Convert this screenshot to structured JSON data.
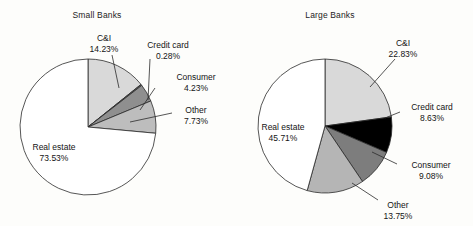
{
  "figure": {
    "background": "#fdfdfb",
    "line_color": "#2b2b2b",
    "text_color": "#141414"
  },
  "panels": [
    {
      "key": "small",
      "title": "Small Banks",
      "title_x": 97,
      "title_y": 10,
      "cx": 88,
      "cy": 127,
      "r": 68,
      "start_angle_deg": -90,
      "labels": [
        {
          "name": "C&I",
          "value": "14.23%",
          "x": 104,
          "y": 33,
          "align": "center",
          "leader": [
            112,
            55,
            119,
            88
          ]
        },
        {
          "name": "Credit card",
          "value": "0.28%",
          "x": 168,
          "y": 40,
          "align": "center",
          "leader": [
            150,
            59,
            148,
            100
          ]
        },
        {
          "name": "Consumer",
          "value": "4.23%",
          "x": 196,
          "y": 72,
          "align": "center",
          "leader": [
            155,
            88,
            140,
            110
          ]
        },
        {
          "name": "Other",
          "value": "7.73%",
          "x": 196,
          "y": 105,
          "align": "center",
          "leader": [
            172,
            113,
            130,
            122
          ]
        },
        {
          "name": "Real estate",
          "value": "73.53%",
          "x": 54,
          "y": 142,
          "align": "center",
          "leader": null
        }
      ]
    },
    {
      "key": "large",
      "title": "Large Banks",
      "title_x": 330,
      "title_y": 10,
      "cx": 325,
      "cy": 126,
      "r": 67,
      "start_angle_deg": -90,
      "labels": [
        {
          "name": "C&I",
          "value": "22.83%",
          "x": 403,
          "y": 38,
          "align": "center",
          "leader": [
            395,
            59,
            370,
            87
          ]
        },
        {
          "name": "Credit card",
          "value": "8.63%",
          "x": 432,
          "y": 102,
          "align": "center",
          "leader": [
            400,
            112,
            385,
            118
          ]
        },
        {
          "name": "Consumer",
          "value": "9.08%",
          "x": 431,
          "y": 160,
          "align": "center",
          "leader": [
            397,
            164,
            372,
            152
          ]
        },
        {
          "name": "Other",
          "value": "13.75%",
          "x": 398,
          "y": 200,
          "align": "center",
          "leader": [
            378,
            200,
            352,
            183
          ]
        },
        {
          "name": "Real estate",
          "value": "45.71%",
          "x": 283,
          "y": 122,
          "align": "center",
          "leader": null
        }
      ]
    }
  ],
  "chart_data": {
    "type": "pie",
    "title": "",
    "charts": [
      {
        "title": "Small Banks",
        "labels": [
          "C&I",
          "Credit card",
          "Consumer",
          "Other",
          "Real estate"
        ],
        "values": [
          14.23,
          0.28,
          4.23,
          7.73,
          73.53
        ],
        "value_labels": [
          "14.23%",
          "0.28%",
          "4.23%",
          "7.73%",
          "73.53%"
        ],
        "colors": [
          "#d9d9d9",
          "#5a5a5a",
          "#8f8f8f",
          "#bdbdbd",
          "#ffffff"
        ],
        "start_angle_deg": -90,
        "direction": "clockwise"
      },
      {
        "title": "Large Banks",
        "labels": [
          "C&I",
          "Credit card",
          "Consumer",
          "Other",
          "Real estate"
        ],
        "values": [
          22.83,
          8.63,
          9.08,
          13.75,
          45.71
        ],
        "value_labels": [
          "22.83%",
          "8.63%",
          "9.08%",
          "13.75%",
          "45.71%"
        ],
        "colors": [
          "#d9d9d9",
          "#000000",
          "#7d7d7d",
          "#b5b5b5",
          "#ffffff"
        ],
        "start_angle_deg": -90,
        "direction": "clockwise"
      }
    ],
    "legend": "none",
    "grid": false,
    "units": "percent"
  }
}
